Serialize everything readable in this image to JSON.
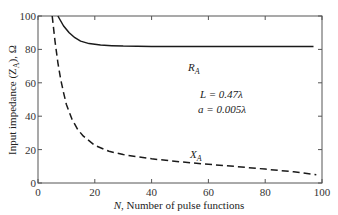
{
  "chart_data": {
    "type": "line",
    "title": "",
    "xlabel": "N, Number of pulse functions",
    "ylabel": "Input impedance (Z_A), Ω",
    "xlim": [
      0,
      100
    ],
    "ylim": [
      0,
      100
    ],
    "xticks": [
      0,
      20,
      40,
      60,
      80,
      100
    ],
    "yticks": [
      0,
      20,
      40,
      60,
      80,
      100
    ],
    "grid": false,
    "series": [
      {
        "name": "R_A",
        "style": "solid",
        "x": [
          7,
          9,
          11,
          13,
          15,
          18,
          22,
          26,
          30,
          40,
          50,
          60,
          70,
          80,
          90,
          97
        ],
        "y": [
          100,
          94,
          90,
          87,
          85,
          83.5,
          82.6,
          82.2,
          82,
          81.8,
          81.8,
          81.8,
          81.8,
          81.8,
          81.8,
          81.8
        ]
      },
      {
        "name": "X_A",
        "style": "dashed",
        "x": [
          5,
          6,
          7,
          8,
          9,
          10,
          12,
          14,
          16,
          20,
          25,
          30,
          40,
          50,
          60,
          70,
          80,
          90,
          98
        ],
        "y": [
          100,
          85,
          72,
          62,
          54,
          47,
          38,
          32,
          28,
          22.5,
          19,
          17,
          14.5,
          12.7,
          11.2,
          9.8,
          8.3,
          6.7,
          5
        ]
      }
    ],
    "annotations": [
      {
        "text": "R_A",
        "x": 55,
        "y": 86
      },
      {
        "text": "X_A",
        "x": 55,
        "y": 25
      },
      {
        "text": "L = 0.47λ",
        "x": 58,
        "y": 55
      },
      {
        "text": "a = 0.005λ",
        "x": 58,
        "y": 47
      }
    ]
  },
  "labels": {
    "xlabel_n": "N",
    "xlabel_rest": ", Number of pulse functions",
    "ylabel": "Input impedance (Z",
    "ylabel_sub": "A",
    "ylabel_rest": "), Ω",
    "ra": "R",
    "ra_sub": "A",
    "xa": "X",
    "xa_sub": "A",
    "param_l": "L = 0.47λ",
    "param_a": "a = 0.005λ"
  }
}
